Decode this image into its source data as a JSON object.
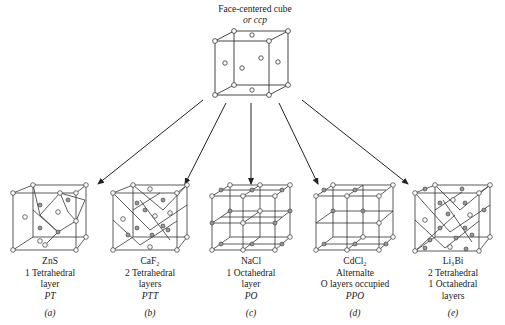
{
  "top": {
    "title_line1": "Face-centered cube",
    "title_line2": "or ccp"
  },
  "structures": [
    {
      "formula": "ZnS",
      "line2": "1 Tetrahedral",
      "line3": "layer",
      "code": "PT",
      "tag": "(a)"
    },
    {
      "formula": "CaF₂",
      "line2": "2 Tetrahedral",
      "line3": "layers",
      "code": "PTT",
      "tag": "(b)"
    },
    {
      "formula": "NaCl",
      "line2": "1 Octahedral",
      "line3": "layer",
      "code": "PO",
      "tag": "(c)"
    },
    {
      "formula": "CdCl₂",
      "line2": "Alternalte",
      "line3": "O layers occupied",
      "code": "PPO",
      "tag": "(d)"
    },
    {
      "formula": "Li₃Bi",
      "line2": "2 Tetrahedral",
      "line3": "1 Octahedral",
      "code": "layers",
      "tag": "(e)"
    }
  ]
}
